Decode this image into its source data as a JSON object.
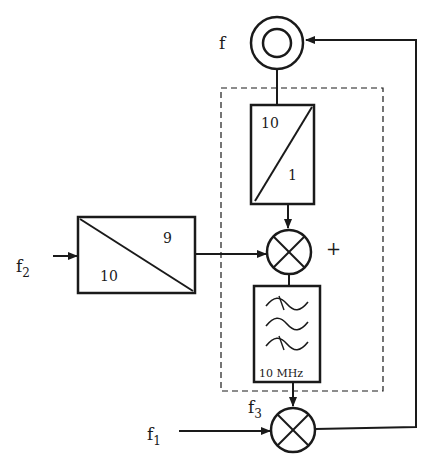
{
  "diagram": {
    "type": "block-diagram",
    "colors": {
      "stroke": "#1a1a1a",
      "background": "#ffffff"
    },
    "labels": {
      "output_freq": "f",
      "input_f2_main": "f",
      "input_f2_sub": "2",
      "input_f1_main": "f",
      "input_f1_sub": "1",
      "f3_main": "f",
      "f3_sub": "3",
      "plus_sign": "+"
    },
    "blocks": {
      "output_terminal": {
        "kind": "double-circle",
        "label": "f"
      },
      "divider_top": {
        "kind": "frequency-divider",
        "numerator": "10",
        "denominator": "1"
      },
      "divider_left": {
        "kind": "frequency-divider",
        "top_right": "9",
        "bottom_left": "10"
      },
      "mixer_upper": {
        "kind": "mixer",
        "sign": "+"
      },
      "bandpass_filter": {
        "kind": "filter",
        "label": "10 MHz"
      },
      "mixer_lower": {
        "kind": "mixer"
      },
      "dashed_enclosure": {
        "kind": "dashed-group"
      }
    },
    "connections": [
      "output_terminal -> divider_top",
      "divider_top -> mixer_upper",
      "f2 -> divider_left",
      "divider_left -> mixer_upper",
      "mixer_upper -> bandpass_filter",
      "bandpass_filter -> mixer_lower (f3)",
      "f1 -> mixer_lower",
      "mixer_lower -> output_terminal (feedback)"
    ]
  }
}
